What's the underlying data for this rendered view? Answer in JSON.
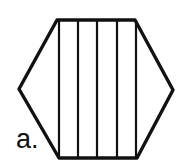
{
  "figure": {
    "label": "a.",
    "shape": "hexagon",
    "stroke_color": "#111111",
    "fill_color": "#ffffff",
    "hexagon_points": [
      [
        57,
        20
      ],
      [
        135,
        20
      ],
      [
        173,
        90
      ],
      [
        137,
        158
      ],
      [
        59,
        158
      ],
      [
        19,
        89
      ]
    ],
    "vertical_lines_x": [
      59,
      78,
      97,
      117,
      136
    ],
    "strip_count": 5
  }
}
